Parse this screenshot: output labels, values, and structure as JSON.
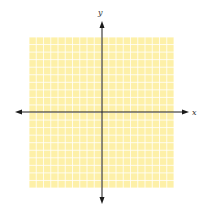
{
  "diagram": {
    "type": "coordinate-plane",
    "x_axis_label": "x",
    "y_axis_label": "y",
    "grid": {
      "cells_x": 20,
      "cells_y": 20,
      "left": 29,
      "top": 37,
      "right": 174,
      "bottom": 188,
      "fill_color": "#fdf0a8",
      "line_color": "#ffffff"
    },
    "origin": {
      "x": 102,
      "y": 112
    },
    "x_axis": {
      "from": 15,
      "to": 189,
      "arrows": "both"
    },
    "y_axis": {
      "from": 21,
      "to": 204,
      "arrows": "both"
    },
    "axis_color": "#1a1a1a"
  }
}
